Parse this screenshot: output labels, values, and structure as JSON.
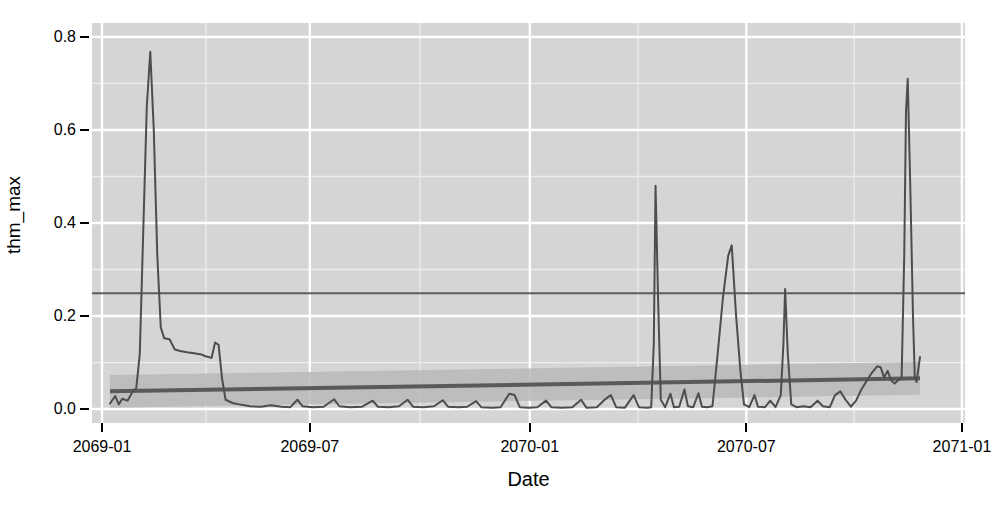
{
  "chart_data": {
    "type": "line",
    "title": "",
    "subtitle": "",
    "xlabel": "Date",
    "ylabel": "thm_max",
    "xlim": [
      "2068-12-10",
      "2071-01-08"
    ],
    "ylim": [
      -0.03,
      0.83
    ],
    "grid": true,
    "legend": null,
    "theme": {
      "panel_background": "#d5d5d5",
      "major_grid_color": "#ffffff",
      "minor_grid_color": "#ededed",
      "series_color": "#4d4d4d",
      "trend_color": "#5a5a5a",
      "ribbon_color": "#b9b9b9",
      "reference_line_color": "#5c5c5c",
      "text_color": "#000000"
    },
    "x_tick_labels": [
      "2069-01",
      "2069-07",
      "2070-01",
      "2070-07",
      "2071-01"
    ],
    "x_tick_values": [
      "2069-01-01",
      "2069-07-01",
      "2070-01-01",
      "2070-07-01",
      "2071-01-01"
    ],
    "y_tick_labels": [
      "0.0",
      "0.2",
      "0.4",
      "0.6",
      "0.8"
    ],
    "y_tick_values": [
      0.0,
      0.2,
      0.4,
      0.6,
      0.8
    ],
    "annotations": [
      {
        "name": "reference-line",
        "type": "hline",
        "y": 0.249,
        "label": ""
      },
      {
        "name": "linear-trend",
        "type": "linear-fit",
        "x_start": "2069-01-05",
        "x_end": "2070-12-15",
        "y_start": 0.038,
        "y_end": 0.066,
        "label": ""
      },
      {
        "name": "confidence-ribbon",
        "type": "ribbon",
        "x_start": "2069-01-05",
        "x_end": "2070-12-15",
        "y_upper_start": 0.073,
        "y_upper_end": 0.101,
        "y_lower_start": 0.003,
        "y_lower_end": 0.031,
        "label": ""
      }
    ],
    "series": [
      {
        "name": "thm_max",
        "color": "#4d4d4d",
        "points": [
          [
            0.0,
            0.012
          ],
          [
            0.006,
            0.028
          ],
          [
            0.01,
            0.01
          ],
          [
            0.014,
            0.022
          ],
          [
            0.02,
            0.018
          ],
          [
            0.026,
            0.038
          ],
          [
            0.03,
            0.045
          ],
          [
            0.034,
            0.118
          ],
          [
            0.038,
            0.385
          ],
          [
            0.042,
            0.65
          ],
          [
            0.046,
            0.768
          ],
          [
            0.05,
            0.6
          ],
          [
            0.054,
            0.33
          ],
          [
            0.058,
            0.175
          ],
          [
            0.062,
            0.152
          ],
          [
            0.068,
            0.15
          ],
          [
            0.074,
            0.128
          ],
          [
            0.08,
            0.125
          ],
          [
            0.088,
            0.122
          ],
          [
            0.096,
            0.12
          ],
          [
            0.103,
            0.118
          ],
          [
            0.11,
            0.113
          ],
          [
            0.116,
            0.11
          ],
          [
            0.12,
            0.143
          ],
          [
            0.124,
            0.138
          ],
          [
            0.128,
            0.065
          ],
          [
            0.132,
            0.02
          ],
          [
            0.14,
            0.013
          ],
          [
            0.15,
            0.009
          ],
          [
            0.16,
            0.006
          ],
          [
            0.172,
            0.005
          ],
          [
            0.184,
            0.008
          ],
          [
            0.196,
            0.005
          ],
          [
            0.206,
            0.004
          ],
          [
            0.214,
            0.02
          ],
          [
            0.22,
            0.006
          ],
          [
            0.232,
            0.004
          ],
          [
            0.244,
            0.005
          ],
          [
            0.256,
            0.021
          ],
          [
            0.262,
            0.006
          ],
          [
            0.274,
            0.004
          ],
          [
            0.288,
            0.005
          ],
          [
            0.3,
            0.018
          ],
          [
            0.306,
            0.005
          ],
          [
            0.318,
            0.004
          ],
          [
            0.33,
            0.006
          ],
          [
            0.34,
            0.02
          ],
          [
            0.346,
            0.005
          ],
          [
            0.358,
            0.004
          ],
          [
            0.37,
            0.006
          ],
          [
            0.38,
            0.019
          ],
          [
            0.386,
            0.005
          ],
          [
            0.398,
            0.004
          ],
          [
            0.408,
            0.005
          ],
          [
            0.418,
            0.017
          ],
          [
            0.424,
            0.004
          ],
          [
            0.436,
            0.003
          ],
          [
            0.446,
            0.004
          ],
          [
            0.456,
            0.033
          ],
          [
            0.462,
            0.03
          ],
          [
            0.468,
            0.004
          ],
          [
            0.478,
            0.003
          ],
          [
            0.488,
            0.004
          ],
          [
            0.498,
            0.018
          ],
          [
            0.504,
            0.004
          ],
          [
            0.516,
            0.003
          ],
          [
            0.528,
            0.004
          ],
          [
            0.538,
            0.02
          ],
          [
            0.544,
            0.003
          ],
          [
            0.556,
            0.004
          ],
          [
            0.566,
            0.022
          ],
          [
            0.572,
            0.03
          ],
          [
            0.578,
            0.004
          ],
          [
            0.588,
            0.003
          ],
          [
            0.598,
            0.03
          ],
          [
            0.604,
            0.004
          ],
          [
            0.614,
            0.003
          ],
          [
            0.618,
            0.004
          ],
          [
            0.621,
            0.14
          ],
          [
            0.623,
            0.48
          ],
          [
            0.626,
            0.23
          ],
          [
            0.629,
            0.02
          ],
          [
            0.634,
            0.004
          ],
          [
            0.64,
            0.033
          ],
          [
            0.644,
            0.004
          ],
          [
            0.65,
            0.005
          ],
          [
            0.656,
            0.042
          ],
          [
            0.66,
            0.006
          ],
          [
            0.666,
            0.004
          ],
          [
            0.672,
            0.034
          ],
          [
            0.676,
            0.005
          ],
          [
            0.682,
            0.004
          ],
          [
            0.688,
            0.006
          ],
          [
            0.694,
            0.12
          ],
          [
            0.7,
            0.24
          ],
          [
            0.706,
            0.33
          ],
          [
            0.71,
            0.352
          ],
          [
            0.715,
            0.2
          ],
          [
            0.72,
            0.08
          ],
          [
            0.724,
            0.01
          ],
          [
            0.73,
            0.004
          ],
          [
            0.736,
            0.03
          ],
          [
            0.74,
            0.005
          ],
          [
            0.748,
            0.004
          ],
          [
            0.754,
            0.018
          ],
          [
            0.76,
            0.004
          ],
          [
            0.766,
            0.03
          ],
          [
            0.769,
            0.14
          ],
          [
            0.771,
            0.258
          ],
          [
            0.774,
            0.12
          ],
          [
            0.778,
            0.01
          ],
          [
            0.784,
            0.004
          ],
          [
            0.792,
            0.006
          ],
          [
            0.8,
            0.004
          ],
          [
            0.808,
            0.018
          ],
          [
            0.814,
            0.006
          ],
          [
            0.822,
            0.004
          ],
          [
            0.828,
            0.03
          ],
          [
            0.834,
            0.038
          ],
          [
            0.84,
            0.02
          ],
          [
            0.846,
            0.005
          ],
          [
            0.852,
            0.018
          ],
          [
            0.858,
            0.042
          ],
          [
            0.864,
            0.06
          ],
          [
            0.87,
            0.078
          ],
          [
            0.876,
            0.092
          ],
          [
            0.88,
            0.09
          ],
          [
            0.884,
            0.068
          ],
          [
            0.888,
            0.082
          ],
          [
            0.892,
            0.062
          ],
          [
            0.896,
            0.055
          ],
          [
            0.9,
            0.062
          ],
          [
            0.904,
            0.066
          ],
          [
            0.907,
            0.33
          ],
          [
            0.909,
            0.64
          ],
          [
            0.911,
            0.71
          ],
          [
            0.914,
            0.47
          ],
          [
            0.917,
            0.2
          ],
          [
            0.919,
            0.07
          ],
          [
            0.921,
            0.058
          ],
          [
            0.923,
            0.085
          ],
          [
            0.925,
            0.112
          ]
        ]
      }
    ]
  }
}
